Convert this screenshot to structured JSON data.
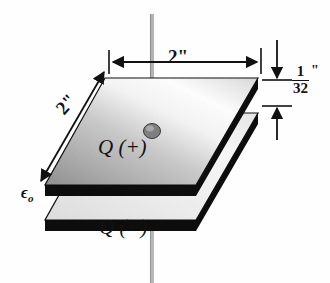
{
  "figure": {
    "background_color": "#fefefe",
    "ink_color": "#111111"
  },
  "labels": {
    "width_top": "2\"",
    "depth_left": "2\"",
    "charge_positive": "Q (+)",
    "charge_negative": "Q (−)",
    "permittivity_symbol": "ϵ",
    "permittivity_subscript": "o",
    "gap_numerator": "1",
    "gap_denominator": "32",
    "gap_inch_mark": "\""
  },
  "geometry": {
    "top_plate": {
      "name": "positive-plate",
      "fill_light": "#fdfdfd",
      "fill_dark": "#9c9c9c",
      "edge_color": "#0d0d0d",
      "corners_top_face": "105,78 258,78 196,185 45,185",
      "thickness_px": 11
    },
    "bottom_plate": {
      "name": "negative-plate",
      "fill_light": "#efefef",
      "fill_dark": "#d2d2d2",
      "edge_color": "#0d0d0d",
      "corners_top_face": "105,113 258,113 196,220 45,220",
      "thickness_px": 11
    },
    "wire": {
      "name": "lead-wire",
      "color": "#9a9a9a",
      "x": 152,
      "top_y": 14,
      "bottom_y": 283,
      "width_px": 4
    },
    "terminal_knob": {
      "name": "terminal-knob",
      "cx": 152,
      "cy": 131,
      "rx": 8,
      "ry": 7,
      "fill": "#8d8d8d"
    }
  },
  "dimensions": {
    "top_span": {
      "name": "width-dimension",
      "y": 62,
      "x_start": 109,
      "x_end": 261,
      "value": "2\""
    },
    "left_span": {
      "name": "depth-dimension",
      "x_start": 104,
      "y_start": 72,
      "x_end": 41,
      "y_end": 181,
      "value": "2\""
    },
    "gap_span": {
      "name": "thickness-dimension",
      "x": 277,
      "upper_y": 40,
      "plate_top_y": 80,
      "plate_bottom_y": 105,
      "lower_y": 140,
      "value": "1/32\""
    }
  }
}
